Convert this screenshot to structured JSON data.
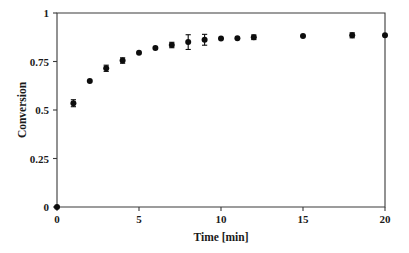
{
  "chart_data": {
    "type": "scatter",
    "title": "",
    "xlabel": "Time [min]",
    "ylabel": "Conversion",
    "xlim": [
      0,
      20
    ],
    "ylim": [
      0,
      1
    ],
    "xticks": [
      0,
      5,
      10,
      15,
      20
    ],
    "xtick_labels": [
      "0",
      "5",
      "10",
      "15",
      "20"
    ],
    "yticks": [
      0,
      0.25,
      0.5,
      0.75,
      1
    ],
    "ytick_labels": [
      "0",
      "0.25",
      "0.5",
      "0.75",
      "1"
    ],
    "grid": false,
    "legend": null,
    "marker": "filled-circle",
    "marker_color": "#0d0d0d",
    "error_bars": "yerr",
    "x": [
      0,
      1,
      2,
      3,
      4,
      5,
      6,
      7,
      8,
      9,
      10,
      11,
      12,
      15,
      18,
      20
    ],
    "y": [
      0.0,
      0.535,
      0.65,
      0.715,
      0.755,
      0.795,
      0.82,
      0.835,
      0.85,
      0.862,
      0.868,
      0.87,
      0.875,
      0.881,
      0.885,
      0.885
    ],
    "yerr": [
      0.0,
      0.018,
      0.0,
      0.016,
      0.014,
      0.0,
      0.0,
      0.014,
      0.038,
      0.028,
      0.0,
      0.0,
      0.012,
      0.0,
      0.013,
      0.0
    ]
  },
  "axes": {
    "xlabel": "Time [min]",
    "ylabel": "Conversion",
    "xtick_0": "0",
    "xtick_1": "5",
    "xtick_2": "10",
    "xtick_3": "15",
    "xtick_4": "20",
    "ytick_0": "0",
    "ytick_1": "0.25",
    "ytick_2": "0.5",
    "ytick_3": "0.75",
    "ytick_4": "1"
  }
}
